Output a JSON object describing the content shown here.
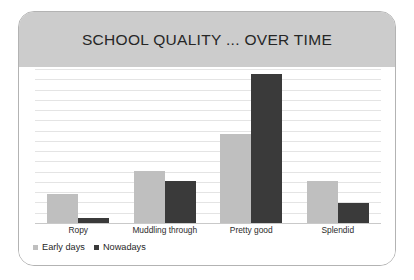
{
  "card": {
    "title": "SCHOOL QUALITY ... OVER TIME"
  },
  "legend": {
    "entries": [
      {
        "label": "Early days",
        "color": "#bfbfbf",
        "swatch": "square-swatch-icon"
      },
      {
        "label": "Nowadays",
        "color": "#3a3a3a",
        "swatch": "square-swatch-icon"
      }
    ]
  },
  "colors": {
    "header_band": "#cccccc",
    "card_border": "#b3b3b3",
    "gridline": "#e4e4e4",
    "baseline": "#c9c9c9",
    "early_days": "#bfbfbf",
    "nowadays": "#3a3a3a",
    "title_text": "#262626"
  },
  "chart_data": {
    "type": "bar",
    "title": "SCHOOL QUALITY ... OVER TIME",
    "xlabel": "",
    "ylabel": "",
    "categories": [
      "Ropy",
      "Muddling through",
      "Pretty good",
      "Splendid"
    ],
    "series": [
      {
        "name": "Early days",
        "color": "#bfbfbf",
        "values": [
          19,
          34,
          58,
          27
        ]
      },
      {
        "name": "Nowadays",
        "color": "#3a3a3a",
        "values": [
          3,
          27,
          97,
          13
        ]
      }
    ],
    "ylim": [
      0,
      100
    ],
    "grid": true,
    "gridline_count": 15,
    "axis_tick_labels": [],
    "legend_position": "bottom-left",
    "value_units": "percent of plot height"
  }
}
